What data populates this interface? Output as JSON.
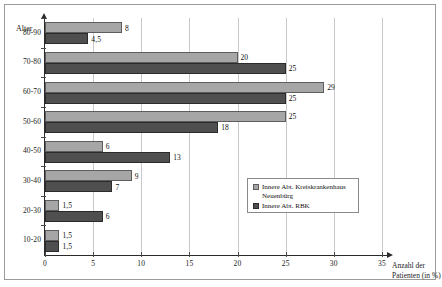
{
  "chart_data": {
    "type": "bar",
    "orientation": "horizontal",
    "title": "",
    "xlabel": "Anzahl der Patienten (in %)",
    "ylabel": "Alter",
    "xlim": [
      0,
      35
    ],
    "xticks": [
      0,
      5,
      10,
      15,
      20,
      25,
      30,
      35
    ],
    "xtick_labels": [
      "0",
      "5",
      "10",
      "15",
      "20",
      "25",
      "30",
      "35"
    ],
    "grid": true,
    "legend_position": "inside-right-lower",
    "categories": [
      "80-90",
      "70-80",
      "60-70",
      "50-60",
      "40-50",
      "30-40",
      "20-30",
      "10-20"
    ],
    "series": [
      {
        "name": "Innere Abt. Kreiskrankenhaus Neuenbürg",
        "color": "#a6a6a6",
        "values": [
          8,
          20,
          29,
          25,
          6,
          9,
          1.5,
          1.5
        ],
        "value_labels": [
          "8",
          "20",
          "29",
          "25",
          "6",
          "9",
          "1,5",
          "1,5"
        ]
      },
      {
        "name": "Innere Abt. RBK",
        "color": "#4f4f4f",
        "values": [
          4.5,
          25,
          25,
          18,
          13,
          7,
          6,
          1.5
        ],
        "value_labels": [
          "4,5",
          "25",
          "25",
          "18",
          "13",
          "7",
          "6",
          "1,5"
        ]
      }
    ]
  },
  "legend": {
    "entries": [
      {
        "label_line1": "Innere Abt. Kreiskrankenhaus",
        "label_line2": "Neuenbürg",
        "swatch": "light-gray-swatch"
      },
      {
        "label_line1": "Innere Abt. RBK",
        "label_line2": "",
        "swatch": "dark-gray-swatch"
      }
    ]
  },
  "axes": {
    "y_title": "Alter",
    "x_title_line1": "Anzahl der",
    "x_title_line2": "Patienten (in %)"
  },
  "colors": {
    "series_light": "#a6a6a6",
    "series_dark": "#4f4f4f",
    "axis": "#2a2a2a",
    "grid": "#c9c9c9",
    "frame": "#9a9a9a"
  }
}
